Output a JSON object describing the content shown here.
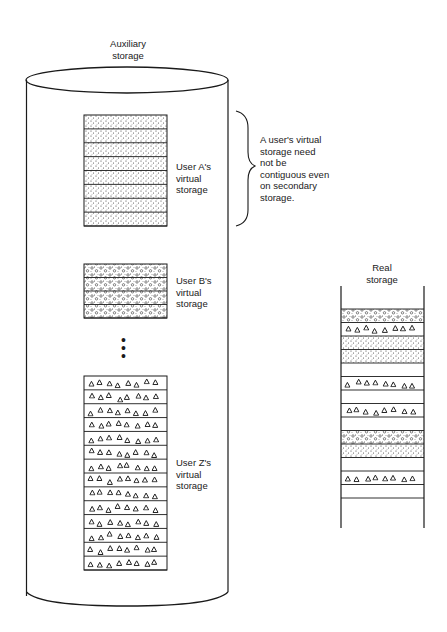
{
  "figure": {
    "auxiliary_label": "Auxiliary\nstorage",
    "real_label": "Real\nstorage",
    "annotation": "A user's virtual\nstorage need\nnot be\ncontiguous even\non secondary\nstorage.",
    "ellipsis": "⋮"
  },
  "users": [
    {
      "id": "A",
      "label": "User A's\nvirtual\nstorage",
      "pattern": "dots",
      "rows": 8
    },
    {
      "id": "B",
      "label": "User B's\nvirtual\nstorage",
      "pattern": "circles",
      "rows": 4
    },
    {
      "id": "Z",
      "label": "User Z's\nvirtual\nstorage",
      "pattern": "triangles",
      "rows": 14
    }
  ],
  "real_storage_frames": [
    "circles",
    "triangles",
    "dots",
    "dots",
    "empty",
    "triangles",
    "empty",
    "triangles",
    "empty",
    "circles",
    "dots",
    "empty",
    "triangles",
    "empty"
  ],
  "colors": {
    "ink": "#1a1a1a",
    "background": "#ffffff"
  }
}
